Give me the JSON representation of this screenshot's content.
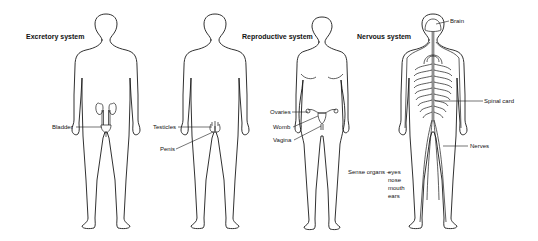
{
  "diagram": {
    "panels": [
      {
        "id": "excretory",
        "title": "Excretory system",
        "figure": "male",
        "labels": [
          {
            "text": "Bladder"
          }
        ]
      },
      {
        "id": "reproductive",
        "title": "Reproductive system",
        "figures": [
          "male",
          "female"
        ],
        "labels": [
          {
            "text": "Testicles"
          },
          {
            "text": "Penis"
          },
          {
            "text": "Ovaries"
          },
          {
            "text": "Womb"
          },
          {
            "text": "Vagina"
          }
        ]
      },
      {
        "id": "nervous",
        "title": "Nervous system",
        "figure": "neutral",
        "labels": [
          {
            "text": "Brain"
          },
          {
            "text": "Spinal card"
          },
          {
            "text": "Nerves"
          }
        ],
        "sense_organs": {
          "heading": "Sense organs –",
          "items": [
            "eyes",
            "nose",
            "mouth",
            "ears"
          ]
        }
      }
    ],
    "colors": {
      "line": "#1a1a1a",
      "background": "#ffffff",
      "text": "#111111"
    }
  }
}
